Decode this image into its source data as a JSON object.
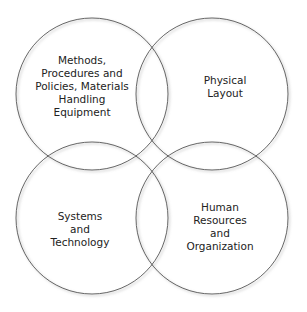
{
  "diagram": {
    "type": "four-circle overlapping venn",
    "circles": [
      {
        "id": "top-left",
        "lines": [
          "Methods,",
          "Procedures and",
          "Policies, Materials",
          "Handling",
          "Equipment"
        ]
      },
      {
        "id": "top-right",
        "lines": [
          "Physical",
          "Layout"
        ]
      },
      {
        "id": "bottom-left",
        "lines": [
          "Systems",
          "and",
          "Technology"
        ]
      },
      {
        "id": "bottom-right",
        "lines": [
          "Human",
          "Resources",
          "and",
          "Organization"
        ]
      }
    ],
    "stroke_color": "#555555",
    "shadow_color": "#999999"
  }
}
